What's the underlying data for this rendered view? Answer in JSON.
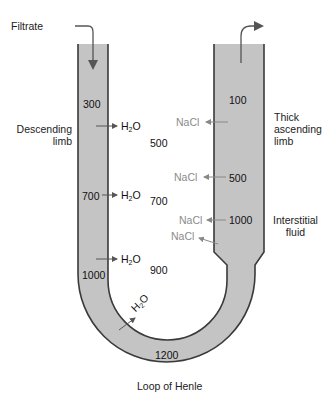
{
  "title": "Loop of Henle",
  "labels": {
    "filtrate": "Filtrate",
    "descending_line1": "Descending",
    "descending_line2": "limb",
    "thick_line1": "Thick",
    "thick_line2": "ascending",
    "thick_line3": "limb",
    "interstitial_line1": "Interstitial",
    "interstitial_line2": "fluid",
    "caption": "Loop of Henle"
  },
  "molecules": {
    "water_main": "H",
    "water_sub": "2",
    "water_tail": "O",
    "salt": "NaCl"
  },
  "tubule_values": {
    "descending_top": "300",
    "descending_mid": "700",
    "descending_low": "1000",
    "loop_bottom": "1200",
    "ascending_top": "100",
    "ascending_mid": "500",
    "ascending_low": "1000"
  },
  "interstitial_values": {
    "v1": "500",
    "v2": "700",
    "v3": "900"
  },
  "colors": {
    "tubule_fill": "#c4c4c4",
    "tubule_stroke": "#3a3a3a",
    "nacl_text": "#8a8a8a",
    "arrow": "#555555"
  }
}
